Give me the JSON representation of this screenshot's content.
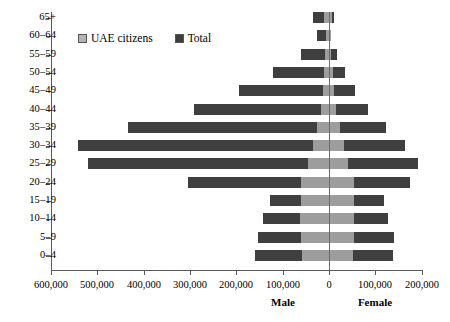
{
  "chart_data": {
    "type": "bar",
    "subtype": "population-pyramid",
    "title": "",
    "xlabel": "",
    "ylabel": "",
    "orientation": "horizontal",
    "grid": false,
    "legend_position": "top-left-inside",
    "categories": [
      "65+",
      "60-64",
      "55-59",
      "50-54",
      "45-49",
      "40-44",
      "35-39",
      "30-34",
      "25-29",
      "20-24",
      "15-19",
      "10-14",
      "5-9",
      "0-4"
    ],
    "x_tick_labels": [
      "600,000",
      "500,000",
      "400,000",
      "300,000",
      "200,000",
      "100,000",
      "0",
      "100,000",
      "200,000"
    ],
    "x_tick_values": [
      -600000,
      -500000,
      -400000,
      -300000,
      -200000,
      -100000,
      0,
      100000,
      200000
    ],
    "xlim": [
      -600000,
      200000
    ],
    "side_labels": [
      "Male",
      "Female"
    ],
    "legend": [
      {
        "name": "UAE citizens",
        "color": "#9d9d9d"
      },
      {
        "name": "Total",
        "color": "#3f3f3f"
      }
    ],
    "series": [
      {
        "name": "Male total",
        "side": "male",
        "layer": "total",
        "color": "#3f3f3f",
        "values": [
          35000,
          26000,
          61000,
          121000,
          194000,
          292000,
          434000,
          542000,
          520000,
          305000,
          128000,
          142000,
          153000,
          160000
        ]
      },
      {
        "name": "Male UAE citizens",
        "side": "male",
        "layer": "uae",
        "color": "#9d9d9d",
        "values": [
          10000,
          7000,
          8000,
          10000,
          13000,
          18000,
          26000,
          35000,
          45000,
          60000,
          61000,
          62000,
          60000,
          58000
        ]
      },
      {
        "name": "Female total",
        "side": "female",
        "layer": "total",
        "color": "#3f3f3f",
        "values": [
          11000,
          5000,
          17000,
          35000,
          57000,
          85000,
          124000,
          164000,
          192000,
          175000,
          119000,
          128000,
          140000,
          138000
        ]
      },
      {
        "name": "Female UAE citizens",
        "side": "female",
        "layer": "uae",
        "color": "#9d9d9d",
        "values": [
          6000,
          4000,
          5000,
          8000,
          11000,
          16000,
          23000,
          33000,
          41000,
          55000,
          54000,
          55000,
          54000,
          52000
        ]
      }
    ]
  }
}
